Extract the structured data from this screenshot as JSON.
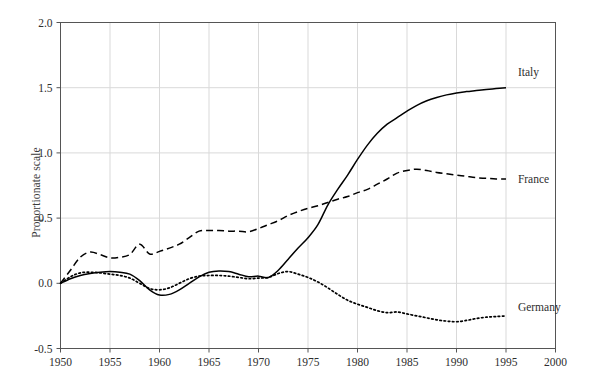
{
  "chart_data": {
    "type": "line",
    "title": "",
    "subtitle": "",
    "xlabel": "",
    "ylabel": "Proportionate scale",
    "xlim": [
      1950,
      2000
    ],
    "ylim": [
      -0.5,
      2.0
    ],
    "xticks": [
      1950,
      1955,
      1960,
      1965,
      1970,
      1975,
      1980,
      1985,
      1990,
      1995,
      2000
    ],
    "xtick_labels": [
      "1950",
      "1955",
      "1960",
      "1965",
      "1970",
      "1975",
      "1980",
      "1985",
      "1990",
      "1995",
      "2000"
    ],
    "yticks": [
      -0.5,
      0.0,
      0.5,
      1.0,
      1.5,
      2.0
    ],
    "ytick_labels": [
      "-0.5",
      "0.0",
      "0.5",
      "1.0",
      "1.5",
      "2.0"
    ],
    "grid": true,
    "grid_color": "#d9d9d9",
    "legend_position": "inline-right",
    "background": "#ffffff",
    "axis_color": "#555555",
    "series": [
      {
        "name": "Italy",
        "label": "Italy",
        "linestyle": "solid",
        "color": "#000000",
        "label_x": 1996.2,
        "label_y": 1.62,
        "x": [
          1950,
          1951,
          1952,
          1953,
          1954,
          1955,
          1956,
          1957,
          1958,
          1959,
          1960,
          1961,
          1962,
          1963,
          1964,
          1965,
          1966,
          1967,
          1968,
          1969,
          1970,
          1971,
          1972,
          1973,
          1974,
          1975,
          1976,
          1977,
          1978,
          1979,
          1980,
          1981,
          1982,
          1983,
          1984,
          1985,
          1986,
          1987,
          1988,
          1989,
          1990,
          1991,
          1992,
          1993,
          1994,
          1995
        ],
        "y": [
          0.0,
          0.035,
          0.06,
          0.075,
          0.085,
          0.09,
          0.085,
          0.07,
          0.02,
          -0.05,
          -0.09,
          -0.085,
          -0.05,
          0.0,
          0.05,
          0.085,
          0.095,
          0.09,
          0.07,
          0.05,
          0.055,
          0.045,
          0.1,
          0.185,
          0.27,
          0.35,
          0.45,
          0.6,
          0.72,
          0.83,
          0.95,
          1.06,
          1.15,
          1.22,
          1.27,
          1.32,
          1.365,
          1.4,
          1.425,
          1.445,
          1.46,
          1.47,
          1.478,
          1.486,
          1.493,
          1.5
        ]
      },
      {
        "name": "France",
        "label": "France",
        "linestyle": "dashed",
        "color": "#000000",
        "label_x": 1996.2,
        "label_y": 0.8,
        "x": [
          1950,
          1951,
          1952,
          1953,
          1954,
          1955,
          1956,
          1957,
          1958,
          1959,
          1960,
          1961,
          1962,
          1963,
          1964,
          1965,
          1966,
          1967,
          1968,
          1969,
          1970,
          1971,
          1972,
          1973,
          1974,
          1975,
          1976,
          1977,
          1978,
          1979,
          1980,
          1981,
          1982,
          1983,
          1984,
          1985,
          1986,
          1987,
          1988,
          1989,
          1990,
          1991,
          1992,
          1993,
          1994,
          1995
        ],
        "y": [
          0.0,
          0.1,
          0.2,
          0.24,
          0.22,
          0.195,
          0.2,
          0.22,
          0.3,
          0.225,
          0.245,
          0.27,
          0.3,
          0.35,
          0.4,
          0.405,
          0.405,
          0.4,
          0.4,
          0.395,
          0.42,
          0.45,
          0.48,
          0.52,
          0.55,
          0.575,
          0.595,
          0.62,
          0.645,
          0.665,
          0.695,
          0.72,
          0.76,
          0.8,
          0.845,
          0.865,
          0.875,
          0.865,
          0.85,
          0.84,
          0.83,
          0.82,
          0.81,
          0.805,
          0.8,
          0.8
        ]
      },
      {
        "name": "Germany",
        "label": "Germany",
        "linestyle": "dotted",
        "color": "#000000",
        "label_x": 1996.2,
        "label_y": -0.18,
        "x": [
          1950,
          1951,
          1952,
          1953,
          1954,
          1955,
          1956,
          1957,
          1958,
          1959,
          1960,
          1961,
          1962,
          1963,
          1964,
          1965,
          1966,
          1967,
          1968,
          1969,
          1970,
          1971,
          1972,
          1973,
          1974,
          1975,
          1976,
          1977,
          1978,
          1979,
          1980,
          1981,
          1982,
          1983,
          1984,
          1985,
          1986,
          1987,
          1988,
          1989,
          1990,
          1991,
          1992,
          1993,
          1994,
          1995
        ],
        "y": [
          0.0,
          0.05,
          0.08,
          0.085,
          0.08,
          0.07,
          0.06,
          0.04,
          0.0,
          -0.04,
          -0.05,
          -0.035,
          0.0,
          0.035,
          0.055,
          0.06,
          0.06,
          0.055,
          0.045,
          0.035,
          0.04,
          0.045,
          0.075,
          0.09,
          0.07,
          0.045,
          0.01,
          -0.035,
          -0.085,
          -0.13,
          -0.16,
          -0.185,
          -0.21,
          -0.225,
          -0.22,
          -0.235,
          -0.25,
          -0.265,
          -0.28,
          -0.29,
          -0.295,
          -0.285,
          -0.27,
          -0.26,
          -0.255,
          -0.25
        ]
      }
    ]
  }
}
